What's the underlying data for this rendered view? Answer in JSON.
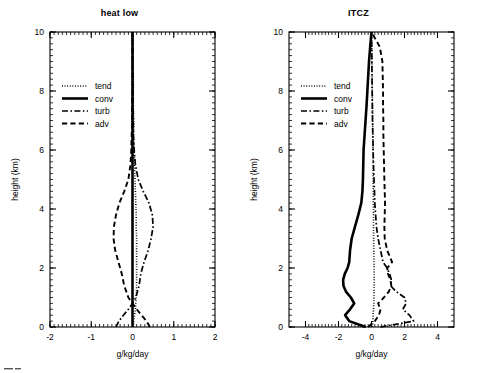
{
  "figure": {
    "width": 478,
    "height": 373,
    "background": "#ffffff",
    "foreground": "#000000"
  },
  "panels": [
    {
      "id": "heat-low",
      "title": "heat low",
      "xlabel": "g/kg/day",
      "ylabel": "height (km)",
      "xlim": [
        -2,
        2
      ],
      "ylim": [
        0,
        10
      ],
      "xticks": [
        -2,
        -1,
        0,
        1,
        2
      ],
      "xtick_labels": [
        "-2",
        "-1",
        "0",
        "1",
        "2"
      ],
      "yticks": [
        0,
        2,
        4,
        6,
        8,
        10
      ],
      "ytick_labels": [
        "0",
        "2",
        "4",
        "6",
        "8",
        "10"
      ],
      "minor_per_major": 10,
      "show_ylabel": true,
      "legend": [
        {
          "key": "tend",
          "label": "tend",
          "style": "dotted"
        },
        {
          "key": "conv",
          "label": "conv",
          "style": "thick-solid"
        },
        {
          "key": "turb",
          "label": "turb",
          "style": "dash-dot"
        },
        {
          "key": "adv",
          "label": "adv",
          "style": "dashed"
        }
      ]
    },
    {
      "id": "itcz",
      "title": "ITCZ",
      "xlabel": "g/kg/day",
      "ylabel": "height (km)",
      "xlim": [
        -5,
        5
      ],
      "ylim": [
        0,
        10
      ],
      "xticks": [
        -4,
        -2,
        0,
        2,
        4
      ],
      "xtick_labels": [
        "-4",
        "-2",
        "0",
        "2",
        "4"
      ],
      "yticks": [
        0,
        2,
        4,
        6,
        8,
        10
      ],
      "ytick_labels": [
        "0",
        "2",
        "4",
        "6",
        "8",
        "10"
      ],
      "minor_per_major": 10,
      "show_ylabel": true,
      "legend": [
        {
          "key": "tend",
          "label": "tend",
          "style": "dotted"
        },
        {
          "key": "conv",
          "label": "conv",
          "style": "thick-solid"
        },
        {
          "key": "turb",
          "label": "turb",
          "style": "dash-dot"
        },
        {
          "key": "adv",
          "label": "adv",
          "style": "dashed"
        }
      ]
    }
  ],
  "chart_data": [
    {
      "type": "line",
      "panel": "heat low",
      "title": "heat low",
      "xlabel": "g/kg/day",
      "ylabel": "height (km)",
      "xlim": [
        -2,
        2
      ],
      "ylim": [
        0,
        10
      ],
      "grid": false,
      "legend_position": "upper-left",
      "orientation": "vertical-profile",
      "note": "x = moisture tendency (g/kg/day), y = height (km)",
      "series": [
        {
          "name": "tend",
          "style": "dotted",
          "y": [
            0.0,
            0.2,
            0.4,
            0.6,
            0.8,
            1.0,
            1.4,
            1.8,
            2.2,
            2.6,
            3.0,
            3.4,
            3.8,
            4.2,
            4.6,
            5.0,
            5.5,
            6.0,
            6.5,
            7.0,
            7.5,
            8.0,
            8.5,
            9.0,
            9.5,
            10.0
          ],
          "x": [
            0.02,
            0.03,
            0.05,
            0.07,
            0.08,
            0.09,
            0.1,
            0.1,
            0.1,
            0.1,
            0.1,
            0.09,
            0.09,
            0.08,
            0.07,
            0.06,
            0.05,
            0.04,
            0.03,
            0.03,
            0.02,
            0.02,
            0.02,
            0.01,
            0.01,
            0.0
          ]
        },
        {
          "name": "conv",
          "style": "thick-solid",
          "y": [
            0.0,
            0.2,
            0.4,
            0.6,
            0.8,
            1.0,
            1.4,
            1.8,
            2.2,
            2.6,
            3.0,
            3.4,
            3.8,
            4.2,
            4.6,
            5.0,
            5.5,
            6.0,
            6.5,
            7.0,
            7.5,
            8.0,
            8.5,
            9.0,
            9.5,
            10.0
          ],
          "x": [
            0.0,
            0.0,
            0.0,
            0.0,
            0.0,
            0.0,
            0.0,
            0.0,
            0.0,
            0.0,
            0.0,
            0.0,
            0.0,
            0.0,
            0.0,
            0.0,
            0.0,
            0.0,
            0.0,
            0.0,
            0.0,
            0.0,
            0.0,
            0.0,
            0.0,
            0.0
          ]
        },
        {
          "name": "turb",
          "style": "dash-dot",
          "y": [
            0.0,
            0.2,
            0.4,
            0.6,
            0.8,
            1.0,
            1.4,
            1.8,
            2.2,
            2.6,
            3.0,
            3.4,
            3.8,
            4.2,
            4.6,
            5.0,
            5.5,
            6.0,
            6.5,
            7.0,
            7.5,
            8.0,
            8.5,
            9.0,
            9.5,
            10.0
          ],
          "x": [
            -0.4,
            -0.33,
            -0.22,
            -0.1,
            0.0,
            0.08,
            0.16,
            0.2,
            0.28,
            0.38,
            0.45,
            0.5,
            0.48,
            0.4,
            0.26,
            0.14,
            0.07,
            0.04,
            0.02,
            0.02,
            0.01,
            0.01,
            0.01,
            0.0,
            0.0,
            0.0
          ]
        },
        {
          "name": "adv",
          "style": "dashed",
          "y": [
            0.0,
            0.2,
            0.4,
            0.6,
            0.8,
            1.0,
            1.4,
            1.8,
            2.2,
            2.6,
            3.0,
            3.4,
            3.8,
            4.2,
            4.6,
            5.0,
            5.5,
            6.0,
            6.5,
            7.0,
            7.5,
            8.0,
            8.5,
            9.0,
            9.5,
            10.0
          ],
          "x": [
            0.42,
            0.34,
            0.22,
            0.1,
            0.0,
            -0.1,
            -0.2,
            -0.26,
            -0.34,
            -0.42,
            -0.46,
            -0.45,
            -0.4,
            -0.32,
            -0.2,
            -0.1,
            -0.05,
            -0.03,
            -0.02,
            -0.01,
            -0.01,
            0.0,
            0.0,
            0.0,
            0.0,
            0.0
          ]
        }
      ]
    },
    {
      "type": "line",
      "panel": "ITCZ",
      "title": "ITCZ",
      "xlabel": "g/kg/day",
      "ylabel": "height (km)",
      "xlim": [
        -5,
        5
      ],
      "ylim": [
        0,
        10
      ],
      "grid": false,
      "legend_position": "upper-left",
      "orientation": "vertical-profile",
      "note": "x = moisture tendency (g/kg/day), y = height (km)",
      "series": [
        {
          "name": "tend",
          "style": "dotted",
          "y": [
            0.0,
            0.2,
            0.4,
            0.6,
            0.8,
            1.0,
            1.4,
            1.8,
            2.2,
            2.6,
            3.0,
            3.4,
            3.8,
            4.2,
            4.6,
            5.0,
            5.5,
            6.0,
            6.5,
            7.0,
            7.5,
            8.0,
            8.5,
            9.0,
            9.5,
            10.0
          ],
          "x": [
            0.05,
            0.08,
            0.1,
            0.12,
            0.14,
            0.15,
            0.16,
            0.16,
            0.15,
            0.14,
            0.13,
            0.12,
            0.12,
            0.11,
            0.11,
            0.1,
            0.1,
            0.09,
            0.08,
            0.07,
            0.06,
            0.05,
            0.04,
            0.03,
            0.02,
            0.0
          ]
        },
        {
          "name": "conv",
          "style": "thick-solid",
          "y": [
            0.0,
            0.2,
            0.4,
            0.6,
            0.8,
            1.0,
            1.2,
            1.4,
            1.6,
            1.8,
            2.0,
            2.2,
            2.6,
            3.0,
            3.4,
            3.8,
            4.2,
            4.6,
            5.0,
            5.5,
            6.0,
            6.5,
            7.0,
            7.5,
            8.0,
            8.5,
            9.0,
            9.5,
            10.0
          ],
          "x": [
            -0.35,
            -1.35,
            -1.6,
            -1.3,
            -1.05,
            -1.25,
            -1.55,
            -1.7,
            -1.72,
            -1.62,
            -1.45,
            -1.35,
            -1.3,
            -1.2,
            -1.0,
            -0.8,
            -0.62,
            -0.55,
            -0.52,
            -0.5,
            -0.48,
            -0.42,
            -0.36,
            -0.3,
            -0.25,
            -0.2,
            -0.15,
            -0.08,
            0.0
          ]
        },
        {
          "name": "turb",
          "style": "dash-dot",
          "y": [
            0.0,
            0.2,
            0.4,
            0.6,
            0.8,
            1.0,
            1.2,
            1.4,
            1.6,
            1.8,
            2.0,
            2.2,
            2.6,
            3.0,
            3.4,
            3.8,
            4.2,
            4.6,
            5.0,
            5.5,
            6.0,
            6.5,
            7.0,
            7.5,
            8.0,
            8.5,
            9.0,
            9.5,
            10.0
          ],
          "x": [
            0.55,
            2.55,
            2.3,
            1.9,
            2.1,
            2.0,
            1.5,
            1.15,
            1.2,
            1.1,
            0.95,
            0.7,
            0.55,
            0.4,
            0.3,
            0.25,
            0.2,
            0.18,
            0.15,
            0.12,
            0.1,
            0.08,
            0.06,
            0.05,
            0.04,
            0.03,
            0.02,
            0.01,
            0.0
          ]
        },
        {
          "name": "adv",
          "style": "dashed",
          "y": [
            0.0,
            0.2,
            0.4,
            0.6,
            0.8,
            1.0,
            1.2,
            1.4,
            1.6,
            1.8,
            2.0,
            2.2,
            2.6,
            3.0,
            3.4,
            3.8,
            4.2,
            4.6,
            5.0,
            5.5,
            6.0,
            6.5,
            7.0,
            7.5,
            8.0,
            8.5,
            9.0,
            9.5,
            10.0
          ],
          "x": [
            -0.2,
            0.2,
            0.45,
            0.55,
            0.4,
            0.75,
            1.05,
            1.2,
            1.15,
            1.0,
            0.95,
            1.25,
            0.95,
            0.8,
            0.78,
            0.8,
            0.82,
            0.8,
            0.78,
            0.76,
            0.74,
            0.72,
            0.72,
            0.7,
            0.7,
            0.68,
            0.66,
            0.5,
            0.0
          ]
        }
      ]
    }
  ]
}
